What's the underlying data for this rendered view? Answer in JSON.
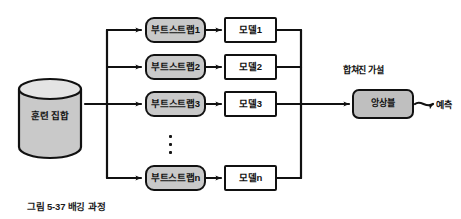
{
  "figure": {
    "caption": "그림 5-37 배깅 과정",
    "colors": {
      "stroke": "#111111",
      "bootstrap_fill": "#c9c9c9",
      "model_fill": "#ffffff",
      "ensemble_fill": "#bfbfbf",
      "cylinder_fill": "#c9c9c9",
      "background": "#ffffff"
    },
    "dataset": {
      "label": "훈련 집합",
      "shape": "cylinder"
    },
    "bootstraps": [
      {
        "label": "부트스트랩1"
      },
      {
        "label": "부트스트랩2"
      },
      {
        "label": "부트스트랩3"
      },
      {
        "label": "부트스트랩n"
      }
    ],
    "models": [
      {
        "label": "모델1"
      },
      {
        "label": "모델2"
      },
      {
        "label": "모델3"
      },
      {
        "label": "모델n"
      }
    ],
    "ellipsis": "⋮",
    "aggregation": {
      "caption": "합쳐진 가설",
      "label": "앙상블"
    },
    "output": {
      "label": "예측"
    }
  }
}
